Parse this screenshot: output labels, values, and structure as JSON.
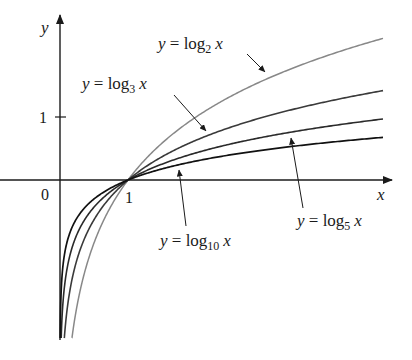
{
  "chart_data": {
    "type": "line",
    "title": "",
    "xlabel": "x",
    "ylabel": "y",
    "origin_label": "0",
    "x_ticks": [
      {
        "value": 1,
        "label": "1"
      }
    ],
    "y_ticks": [
      {
        "value": 1,
        "label": "1"
      }
    ],
    "xlim": [
      -0.88,
      4.75
    ],
    "ylim": [
      -2.85,
      2.5
    ],
    "grid": false,
    "legend": "none (inline labels with arrows)",
    "series": [
      {
        "name": "y = log2 x",
        "base": 2,
        "color": "#888888",
        "x": [
          0.07,
          0.25,
          0.5,
          1,
          2,
          3,
          4,
          4.75
        ],
        "values": [
          -3.84,
          -2.0,
          -1.0,
          0,
          1.0,
          1.585,
          2.0,
          2.248
        ]
      },
      {
        "name": "y = log3 x",
        "base": 3,
        "color": "#3a3a3a",
        "x": [
          0.07,
          0.25,
          0.5,
          1,
          2,
          3,
          4,
          4.75
        ],
        "values": [
          -2.42,
          -1.262,
          -0.631,
          0,
          0.631,
          1.0,
          1.262,
          1.418
        ]
      },
      {
        "name": "y = log5 x",
        "base": 5,
        "color": "#2a2a2a",
        "x": [
          0.07,
          0.25,
          0.5,
          1,
          2,
          3,
          4,
          4.75
        ],
        "values": [
          -1.652,
          -0.861,
          -0.431,
          0,
          0.431,
          0.683,
          0.861,
          0.968
        ]
      },
      {
        "name": "y = log10 x",
        "base": 10,
        "color": "#111111",
        "x": [
          0.07,
          0.25,
          0.5,
          1,
          2,
          3,
          4,
          4.75
        ],
        "values": [
          -1.155,
          -0.602,
          -0.301,
          0,
          0.301,
          0.477,
          0.602,
          0.677
        ]
      }
    ],
    "annotations": [
      {
        "text": "y = log2 x",
        "points_to": "log2 curve"
      },
      {
        "text": "y = log3 x",
        "points_to": "log3 curve"
      },
      {
        "text": "y = log5 x",
        "points_to": "log5 curve"
      },
      {
        "text": "y = log10 x",
        "points_to": "log10 curve"
      }
    ]
  },
  "labels": {
    "x_axis": "x",
    "y_axis": "y",
    "origin": "0",
    "x_tick_1": "1",
    "y_tick_1": "1",
    "log2": {
      "y": "y",
      "eq": " = log",
      "sub": "2",
      "x": "x"
    },
    "log3": {
      "y": "y",
      "eq": " = log",
      "sub": "3",
      "x": "x"
    },
    "log5": {
      "y": "y",
      "eq": " = log",
      "sub": "5",
      "x": "x"
    },
    "log10": {
      "y": "y",
      "eq": " = log",
      "sub": "10",
      "x": "x"
    }
  }
}
